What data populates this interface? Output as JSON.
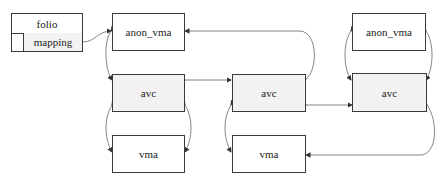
{
  "diagram": {
    "folio": {
      "title": "folio",
      "field": "mapping"
    },
    "nodes": {
      "anon_vma_left": "anon_vma",
      "avc_left": "avc",
      "vma_left": "vma",
      "avc_middle": "avc",
      "vma_middle": "vma",
      "anon_vma_right": "anon_vma",
      "avc_right": "avc"
    },
    "colors": {
      "border": "#3a3a3a",
      "edge": "#555555",
      "fill_grey": "#f2f2f2",
      "fill_white": "#ffffff"
    }
  }
}
